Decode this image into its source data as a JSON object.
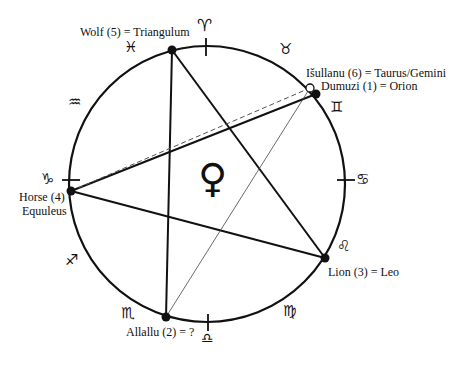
{
  "diagram": {
    "center_symbol": "♀",
    "center_symbol_name": "venus",
    "circle": {
      "cx": 207,
      "cy": 184,
      "r": 138
    },
    "points": [
      {
        "id": "wolf",
        "label": "Wolf (5) = Triangulum",
        "x": 172,
        "y": 50,
        "fill": "filled"
      },
      {
        "id": "isullanu",
        "label": "Išullanu (6) = Taurus/Gemini",
        "x": 310,
        "y": 88,
        "fill": "open"
      },
      {
        "id": "dumuzi",
        "label": "Dumuzi (1) = Orion",
        "x": 316,
        "y": 94,
        "fill": "filled"
      },
      {
        "id": "lion",
        "label": "Lion (3) = Leo",
        "x": 325,
        "y": 258,
        "fill": "filled"
      },
      {
        "id": "allallu",
        "label": "Allallu (2)  = ?",
        "x": 166,
        "y": 317,
        "fill": "filled"
      },
      {
        "id": "horse",
        "label_line1": "Horse (4)",
        "label_line2": "Equuleus",
        "x": 71,
        "y": 191,
        "fill": "filled"
      }
    ],
    "connections": [
      {
        "from": "wolf",
        "to": "allallu",
        "style": "solid"
      },
      {
        "from": "wolf",
        "to": "lion",
        "style": "solid"
      },
      {
        "from": "horse",
        "to": "lion",
        "style": "solid"
      },
      {
        "from": "horse",
        "to": "dumuzi",
        "style": "solid"
      },
      {
        "from": "horse",
        "to": "isullanu",
        "style": "dashed"
      },
      {
        "from": "allallu",
        "to": "isullanu",
        "style": "thin"
      }
    ],
    "zodiac": [
      {
        "name": "aries",
        "symbol": "♈"
      },
      {
        "name": "taurus",
        "symbol": "♉"
      },
      {
        "name": "gemini",
        "symbol": "♊"
      },
      {
        "name": "cancer",
        "symbol": "♋"
      },
      {
        "name": "leo",
        "symbol": "♌"
      },
      {
        "name": "virgo",
        "symbol": "♍"
      },
      {
        "name": "libra",
        "symbol": "♎"
      },
      {
        "name": "scorpio",
        "symbol": "♏"
      },
      {
        "name": "sagittarius",
        "symbol": "♐"
      },
      {
        "name": "capricorn",
        "symbol": "♑"
      },
      {
        "name": "aquarius",
        "symbol": "♒"
      },
      {
        "name": "pisces",
        "symbol": "♓"
      }
    ]
  }
}
